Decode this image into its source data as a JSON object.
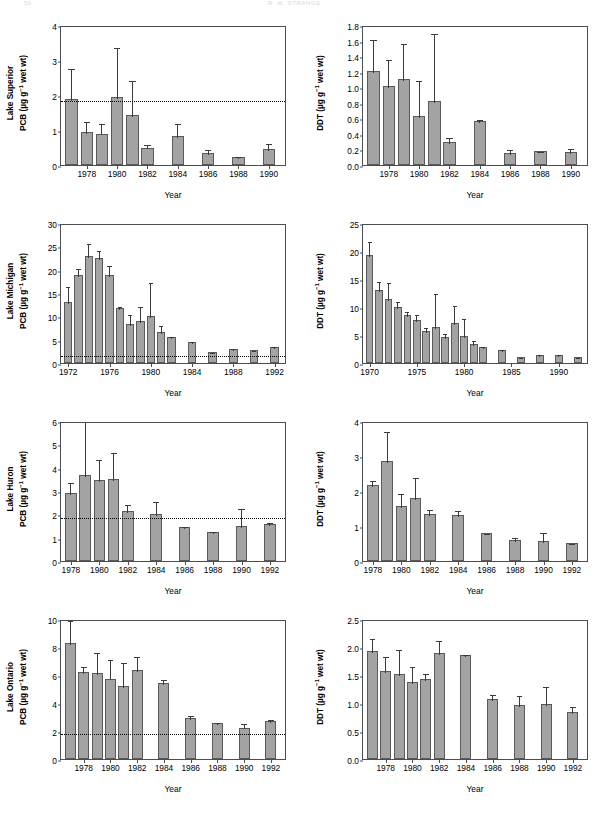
{
  "header": {
    "page_number": "56",
    "running_title": "R. M. STRANGE"
  },
  "figure": {
    "xlabel": "Year",
    "threshold_note": "dotted reference line",
    "bar_color": "#a3a3a3",
    "bar_edge_color": "#5a5a5a",
    "error_color": "#3a3a3a",
    "axis_color": "#4d4d4d"
  },
  "chart_data": [
    {
      "type": "bar",
      "panel": "lake-superior-pcb",
      "lake": "Lake Superior",
      "contaminant": "PCB",
      "ylabel_line1": "Lake Superior",
      "ylabel_line2_prefix": "PCB (µg g",
      "ylabel_line2_sup": "−1",
      "ylabel_line2_suffix": " wet wt)",
      "xlabel": "Year",
      "ylim": [
        0,
        4
      ],
      "yticks": [
        0,
        1,
        2,
        3,
        4
      ],
      "ytick_labels": [
        "0",
        "1",
        "2",
        "3",
        "4"
      ],
      "xlim": [
        1976.3,
        1991.2
      ],
      "xticks": [
        1978,
        1980,
        1982,
        1984,
        1986,
        1988,
        1990
      ],
      "xtick_labels": [
        "1978",
        "1980",
        "1982",
        "1984",
        "1986",
        "1988",
        "1990"
      ],
      "threshold": 1.9,
      "x": [
        1977,
        1978,
        1979,
        1980,
        1981,
        1982,
        1984,
        1986,
        1988,
        1990
      ],
      "values": [
        1.88,
        0.95,
        0.9,
        1.93,
        1.43,
        0.5,
        0.84,
        0.34,
        0.23,
        0.47
      ],
      "err_upper": [
        2.8,
        1.3,
        1.22,
        3.4,
        2.47,
        0.62,
        1.22,
        0.5,
        0.28,
        0.66
      ],
      "err_lower": [
        1.88,
        0.95,
        0.9,
        1.93,
        1.43,
        0.5,
        0.84,
        0.34,
        0.23,
        0.47
      ]
    },
    {
      "type": "bar",
      "panel": "lake-superior-ddt",
      "lake": "Lake Superior",
      "contaminant": "DDT",
      "ylabel_line1": "",
      "ylabel_line2_prefix": "DDT (µg g",
      "ylabel_line2_sup": "−1",
      "ylabel_line2_suffix": " wet wt)",
      "xlabel": "Year",
      "ylim": [
        0,
        1.8
      ],
      "yticks": [
        0,
        0.2,
        0.4,
        0.6,
        0.8,
        1.0,
        1.2,
        1.4,
        1.6,
        1.8
      ],
      "ytick_labels": [
        "0.0",
        "0.2",
        "0.4",
        "0.6",
        "0.8",
        "1.0",
        "1.2",
        "1.4",
        "1.6",
        "1.8"
      ],
      "xlim": [
        1976.3,
        1991.2
      ],
      "xticks": [
        1978,
        1980,
        1982,
        1984,
        1986,
        1988,
        1990
      ],
      "xtick_labels": [
        "1978",
        "1980",
        "1982",
        "1984",
        "1986",
        "1988",
        "1990"
      ],
      "threshold": null,
      "x": [
        1977,
        1978,
        1979,
        1980,
        1981,
        1982,
        1984,
        1986,
        1988,
        1990
      ],
      "values": [
        1.21,
        1.01,
        1.1,
        0.63,
        0.82,
        0.3,
        0.57,
        0.16,
        0.18,
        0.17
      ],
      "err_upper": [
        1.63,
        1.38,
        1.58,
        1.11,
        1.71,
        0.37,
        0.6,
        0.22,
        0.19,
        0.23
      ],
      "err_lower": [
        1.21,
        1.01,
        1.1,
        0.63,
        0.82,
        0.3,
        0.57,
        0.16,
        0.18,
        0.17
      ]
    },
    {
      "type": "bar",
      "panel": "lake-michigan-pcb",
      "lake": "Lake Michigan",
      "contaminant": "PCB",
      "ylabel_line1": "Lake Michigan",
      "ylabel_line2_prefix": "PCB (µg g",
      "ylabel_line2_sup": "−1",
      "ylabel_line2_suffix": " wet wt)",
      "xlabel": "Year",
      "ylim": [
        0,
        30
      ],
      "yticks": [
        0,
        5,
        10,
        15,
        20,
        25,
        30
      ],
      "ytick_labels": [
        "0",
        "5",
        "10",
        "15",
        "20",
        "25",
        "30"
      ],
      "xlim": [
        1971.3,
        1993.2
      ],
      "xticks": [
        1972,
        1976,
        1980,
        1984,
        1988,
        1992
      ],
      "xtick_labels": [
        "1972",
        "1976",
        "1980",
        "1984",
        "1988",
        "1992"
      ],
      "threshold": 2.0,
      "x": [
        1972,
        1973,
        1974,
        1975,
        1976,
        1977,
        1978,
        1979,
        1980,
        1981,
        1982,
        1984,
        1986,
        1988,
        1990,
        1992
      ],
      "values": [
        13.0,
        18.9,
        22.9,
        22.4,
        18.8,
        11.7,
        8.3,
        8.9,
        10.1,
        6.6,
        5.6,
        4.6,
        2.4,
        3.1,
        2.7,
        3.4
      ],
      "err_upper": [
        16.8,
        20.6,
        26.0,
        24.4,
        21.2,
        12.4,
        10.8,
        12.4,
        17.6,
        8.4,
        5.9,
        5.0,
        2.6,
        3.4,
        3.0,
        3.9
      ],
      "err_lower": [
        13.0,
        18.9,
        22.9,
        22.4,
        18.8,
        11.7,
        8.3,
        8.9,
        10.1,
        6.6,
        5.6,
        4.6,
        2.4,
        3.1,
        2.7,
        3.4
      ]
    },
    {
      "type": "bar",
      "panel": "lake-michigan-ddt",
      "lake": "Lake Michigan",
      "contaminant": "DDT",
      "ylabel_line1": "",
      "ylabel_line2_prefix": "DDT (µg g",
      "ylabel_line2_sup": "−1",
      "ylabel_line2_suffix": " wet wt)",
      "xlabel": "Year",
      "ylim": [
        0,
        25
      ],
      "yticks": [
        0,
        5,
        10,
        15,
        20,
        25
      ],
      "ytick_labels": [
        "0",
        "5",
        "10",
        "15",
        "20",
        "25"
      ],
      "xlim": [
        1969.3,
        1993.2
      ],
      "xticks": [
        1970,
        1975,
        1980,
        1985,
        1990
      ],
      "xtick_labels": [
        "1970",
        "1975",
        "1980",
        "1985",
        "1990"
      ],
      "threshold": null,
      "x": [
        1970,
        1971,
        1972,
        1973,
        1974,
        1975,
        1976,
        1977,
        1978,
        1979,
        1980,
        1981,
        1982,
        1984,
        1986,
        1988,
        1990,
        1992
      ],
      "values": [
        19.3,
        13.1,
        11.5,
        10.0,
        8.5,
        7.7,
        5.7,
        6.4,
        4.7,
        7.1,
        4.9,
        3.4,
        2.9,
        2.3,
        1.1,
        1.5,
        1.4,
        1.1
      ],
      "err_upper": [
        22.0,
        14.8,
        14.6,
        11.3,
        9.4,
        9.0,
        6.6,
        12.7,
        5.5,
        10.5,
        8.2,
        4.3,
        3.2,
        2.6,
        1.3,
        1.7,
        1.7,
        1.3
      ],
      "err_lower": [
        19.3,
        13.1,
        11.5,
        10.0,
        8.5,
        7.7,
        5.7,
        6.4,
        4.7,
        7.1,
        4.9,
        3.4,
        2.9,
        2.3,
        1.1,
        1.5,
        1.4,
        1.1
      ]
    },
    {
      "type": "bar",
      "panel": "lake-huron-pcb",
      "lake": "Lake Huron",
      "contaminant": "PCB",
      "ylabel_line1": "Lake Huron",
      "ylabel_line2_prefix": "PCB (µg g",
      "ylabel_line2_sup": "−1",
      "ylabel_line2_suffix": " wet wt)",
      "xlabel": "Year",
      "ylim": [
        0,
        6
      ],
      "yticks": [
        0,
        1,
        2,
        3,
        4,
        5,
        6
      ],
      "ytick_labels": [
        "0",
        "1",
        "2",
        "3",
        "4",
        "5",
        "6"
      ],
      "xlim": [
        1977.3,
        1993.2
      ],
      "xticks": [
        1978,
        1980,
        1982,
        1984,
        1986,
        1988,
        1990,
        1992
      ],
      "xtick_labels": [
        "1978",
        "1980",
        "1982",
        "1984",
        "1986",
        "1988",
        "1990",
        "1992"
      ],
      "threshold": 1.95,
      "x": [
        1978,
        1979,
        1980,
        1981,
        1982,
        1984,
        1986,
        1988,
        1990,
        1992
      ],
      "values": [
        2.93,
        3.68,
        3.46,
        3.53,
        2.15,
        2.0,
        1.44,
        1.23,
        1.52,
        1.58
      ],
      "err_upper": [
        3.42,
        6.05,
        4.42,
        4.73,
        2.48,
        2.62,
        1.56,
        1.35,
        2.32,
        1.7
      ],
      "err_lower": [
        2.93,
        3.68,
        3.46,
        3.53,
        2.15,
        2.0,
        1.44,
        1.23,
        1.52,
        1.58
      ]
    },
    {
      "type": "bar",
      "panel": "lake-huron-ddt",
      "lake": "Lake Huron",
      "contaminant": "DDT",
      "ylabel_line1": "",
      "ylabel_line2_prefix": "DDT (µg g",
      "ylabel_line2_sup": "−1",
      "ylabel_line2_suffix": " wet wt)",
      "xlabel": "Year",
      "ylim": [
        0,
        4
      ],
      "yticks": [
        0,
        1,
        2,
        3,
        4
      ],
      "ytick_labels": [
        "0",
        "1",
        "2",
        "3",
        "4"
      ],
      "xlim": [
        1977.3,
        1993.2
      ],
      "xticks": [
        1978,
        1980,
        1982,
        1984,
        1986,
        1988,
        1990,
        1992
      ],
      "xtick_labels": [
        "1978",
        "1980",
        "1982",
        "1984",
        "1986",
        "1988",
        "1990",
        "1992"
      ],
      "threshold": null,
      "x": [
        1978,
        1979,
        1980,
        1981,
        1982,
        1984,
        1986,
        1988,
        1990,
        1992
      ],
      "values": [
        2.18,
        2.86,
        1.56,
        1.81,
        1.33,
        1.32,
        0.81,
        0.61,
        0.56,
        0.52
      ],
      "err_upper": [
        2.33,
        3.73,
        1.97,
        2.42,
        1.52,
        1.48,
        0.84,
        0.72,
        0.85,
        0.55
      ],
      "err_lower": [
        2.18,
        2.86,
        1.56,
        1.81,
        1.33,
        1.32,
        0.81,
        0.61,
        0.56,
        0.52
      ]
    },
    {
      "type": "bar",
      "panel": "lake-ontario-pcb",
      "lake": "Lake Ontario",
      "contaminant": "PCB",
      "ylabel_line1": "Lake Ontario",
      "ylabel_line2_prefix": "PCB (µg g",
      "ylabel_line2_sup": "−1",
      "ylabel_line2_suffix": " wet wt)",
      "xlabel": "Year",
      "ylim": [
        0,
        10
      ],
      "yticks": [
        0,
        2,
        4,
        6,
        8,
        10
      ],
      "ytick_labels": [
        "0",
        "2",
        "4",
        "6",
        "8",
        "10"
      ],
      "xlim": [
        1976.3,
        1993.2
      ],
      "xticks": [
        1978,
        1980,
        1982,
        1984,
        1986,
        1988,
        1990,
        1992
      ],
      "xtick_labels": [
        "1978",
        "1980",
        "1982",
        "1984",
        "1986",
        "1988",
        "1990",
        "1992"
      ],
      "threshold": 1.9,
      "x": [
        1977,
        1978,
        1979,
        1980,
        1981,
        1982,
        1984,
        1986,
        1988,
        1990,
        1992
      ],
      "values": [
        8.3,
        6.18,
        6.17,
        5.75,
        5.23,
        6.33,
        5.45,
        2.95,
        2.55,
        2.25,
        2.68
      ],
      "err_upper": [
        10.0,
        6.72,
        7.72,
        7.22,
        7.0,
        7.4,
        5.78,
        3.22,
        2.72,
        2.66,
        2.96
      ],
      "err_lower": [
        8.3,
        6.18,
        6.17,
        5.75,
        5.23,
        6.33,
        5.45,
        2.95,
        2.55,
        2.25,
        2.68
      ]
    },
    {
      "type": "bar",
      "panel": "lake-ontario-ddt",
      "lake": "Lake Ontario",
      "contaminant": "DDT",
      "ylabel_line1": "",
      "ylabel_line2_prefix": "DDT (µg g",
      "ylabel_line2_sup": "−1",
      "ylabel_line2_suffix": " wet wt)",
      "xlabel": "Year",
      "ylim": [
        0,
        2.5
      ],
      "yticks": [
        0,
        0.5,
        1.0,
        1.5,
        2.0,
        2.5
      ],
      "ytick_labels": [
        "0.0",
        "0.5",
        "1.0",
        "1.5",
        "2.0",
        "2.5"
      ],
      "xlim": [
        1976.3,
        1993.2
      ],
      "xticks": [
        1978,
        1980,
        1982,
        1984,
        1986,
        1988,
        1990,
        1992
      ],
      "xtick_labels": [
        "1978",
        "1980",
        "1982",
        "1984",
        "1986",
        "1988",
        "1990",
        "1992"
      ],
      "threshold": null,
      "x": [
        1977,
        1978,
        1979,
        1980,
        1981,
        1982,
        1984,
        1986,
        1988,
        1990,
        1992
      ],
      "values": [
        1.93,
        1.58,
        1.52,
        1.38,
        1.42,
        1.89,
        1.85,
        1.08,
        0.96,
        0.98,
        0.84
      ],
      "err_upper": [
        2.17,
        1.85,
        1.99,
        1.68,
        1.56,
        2.15,
        1.9,
        1.17,
        1.16,
        1.32,
        0.97
      ],
      "err_lower": [
        1.93,
        1.58,
        1.52,
        1.38,
        1.42,
        1.89,
        1.85,
        1.08,
        0.96,
        0.98,
        0.84
      ]
    }
  ]
}
